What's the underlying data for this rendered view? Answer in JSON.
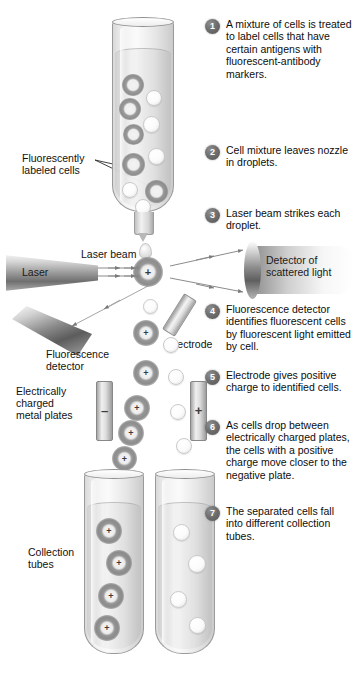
{
  "figure": {
    "background_color": "#ffffff",
    "badge_color": "#5f5f5f",
    "text_color": "#111111"
  },
  "steps": [
    {
      "number": "1",
      "text": "A mixture of cells is treated to label cells that have certain antigens with fluorescent-antibody markers."
    },
    {
      "number": "2",
      "text": "Cell mixture leaves nozzle in droplets."
    },
    {
      "number": "3",
      "text": "Laser beam strikes each droplet."
    },
    {
      "number": "4",
      "text": "Fluorescence detector identifies fluorescent cells by fluorescent light emitted by cell."
    },
    {
      "number": "5",
      "text": "Electrode gives positive charge to identified cells."
    },
    {
      "number": "6",
      "text": "As cells drop between electrically charged plates, the cells with a positive charge move closer to the negative plate."
    },
    {
      "number": "7",
      "text": "The separated cells fall into different collection tubes."
    }
  ],
  "labels": {
    "fluorescently_labeled_cells": "Fluorescently\nlabeled cells",
    "laser": "Laser",
    "laser_beam": "Laser beam",
    "detector_of_scattered_light": "Detector of\nscattered light",
    "electrode": "Electrode",
    "fluorescence_detector": "Fluorescence\ndetector",
    "electrically_charged_metal_plates": "Electrically\ncharged\nmetal plates",
    "collection_tubes": "Collection\ntubes"
  },
  "plates": {
    "negative_sign": "–",
    "positive_sign": "+"
  },
  "charged_cell_sign": "+",
  "counts": {
    "sample_tube_labeled_cells": 5,
    "sample_tube_plain_cells": 5,
    "left_collection_tube_charged_cells": 4,
    "right_collection_tube_plain_cells": 4
  }
}
